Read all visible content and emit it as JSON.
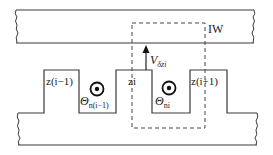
{
  "diagram": {
    "labels": {
      "rotor": "IW",
      "velocity_symbol": "V",
      "velocity_sub": "δzi",
      "tooth_left": "z(i−1)",
      "tooth_center": "zi",
      "tooth_right": "z(i+1)",
      "mmf_left_symbol": "Θ",
      "mmf_left_sub": "n(i−1)",
      "mmf_right_symbol": "Θ",
      "mmf_right_sub": "ni"
    },
    "colors": {
      "line": "#3a3a3a",
      "dash": "#444444",
      "background": "#ffffff"
    }
  }
}
